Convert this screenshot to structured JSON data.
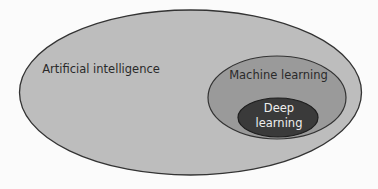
{
  "diagram": {
    "type": "nested-venn",
    "sets": [
      {
        "id": "ai",
        "label": "Artificial intelligence",
        "fill": "#bdbdbd",
        "stroke": "#333333",
        "text_color": "#2a2a2a"
      },
      {
        "id": "ml",
        "label": "Machine learning",
        "fill": "#9a9a9a",
        "stroke": "#333333",
        "text_color": "#2a2a2a",
        "parent": "ai"
      },
      {
        "id": "dl",
        "label_line1": "Deep",
        "label_line2": "learning",
        "fill": "#3a3a3a",
        "stroke": "#1e1e1e",
        "text_color": "#eeeeee",
        "parent": "ml"
      }
    ]
  }
}
